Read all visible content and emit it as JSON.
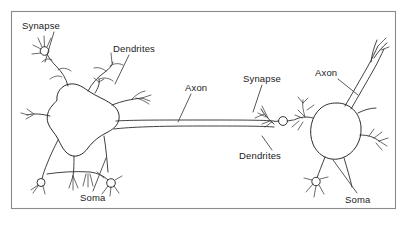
{
  "figure": {
    "background_color": "#ffffff",
    "ink_color": "#2b2b2b",
    "frame_color": "#8a8a8a",
    "frame": {
      "x": 11,
      "y": 11,
      "width": 385,
      "height": 198
    }
  },
  "labels": [
    {
      "id": "synapse-left",
      "text": "Synapse",
      "x": 22,
      "y": 29,
      "leader": "M 54 32 L 45 62"
    },
    {
      "id": "dendrites-left",
      "text": "Dendrites",
      "x": 113,
      "y": 52,
      "leader": "M 129 55 L 115 84"
    },
    {
      "id": "axon-left",
      "text": "Axon",
      "x": 185,
      "y": 91,
      "leader": "M 191 94 L 178 122"
    },
    {
      "id": "synapse-right",
      "text": "Synapse",
      "x": 243,
      "y": 82,
      "leader": "M 262 85 L 253 112"
    },
    {
      "id": "axon-right",
      "text": "Axon",
      "x": 315,
      "y": 76,
      "leader": "M 338 79 L 358 95"
    },
    {
      "id": "dendrites-right",
      "text": "Dendrites",
      "x": 239,
      "y": 159,
      "leader": "M 272 150 L 262 139"
    },
    {
      "id": "soma-left",
      "text": "Soma",
      "x": 80,
      "y": 201,
      "leader": "M 93 191 L 106 160"
    },
    {
      "id": "soma-right",
      "text": "Soma",
      "x": 345,
      "y": 203,
      "leader": "M 357 193 L 333 162"
    }
  ],
  "structures": [
    {
      "id": "neuron-left",
      "part": "soma",
      "shape": "irregular-blob",
      "center_x": 80,
      "center_y": 126
    },
    {
      "id": "neuron-right",
      "part": "soma",
      "shape": "oval",
      "center_x": 337,
      "center_y": 131
    },
    {
      "id": "axon-shaft",
      "part": "axon",
      "shape": "long-horizontal-tube",
      "from_x": 112,
      "to_x": 274,
      "y": 126
    },
    {
      "id": "synaptic-bouton",
      "part": "synaptic-terminal",
      "shape": "circle",
      "center_x": 283,
      "center_y": 121,
      "radius": 4.2
    }
  ],
  "icons": {
    "synapse_terminal": "circle-bouton-icon",
    "dendrite_branch": "branching-tree-icon"
  }
}
